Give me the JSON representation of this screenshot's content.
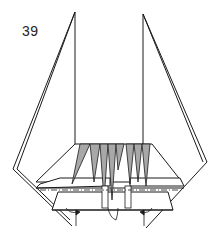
{
  "diagram": {
    "step_number": "39",
    "stroke_color": "#1a1a1a",
    "fill_shaded": "#a8a8a8",
    "fill_paper": "#ffffff"
  }
}
